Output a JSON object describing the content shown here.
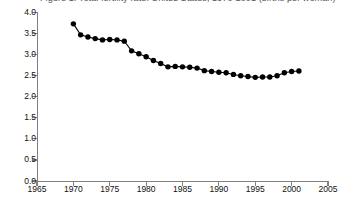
{
  "chart_data": {
    "type": "line",
    "title": "Figure 1. Total fertility rate: United States, 1970-2001 (births per woman)",
    "xlabel": "",
    "ylabel": "",
    "xlim": [
      1965,
      2005
    ],
    "ylim": [
      0.0,
      4.0
    ],
    "grid": false,
    "legend": "none",
    "marker": "filled-circle",
    "marker_color": "#000000",
    "line_color": "#000000",
    "background_color": "#ffffff",
    "axis_color": "#808080",
    "xticks": [
      1965,
      1970,
      1975,
      1980,
      1985,
      1990,
      1995,
      2000,
      2005
    ],
    "xtick_labels": [
      "1965",
      "1970",
      "1975",
      "1980",
      "1985",
      "1990",
      "1995",
      "2000",
      "2005"
    ],
    "yticks": [
      0.0,
      0.5,
      1.0,
      1.5,
      2.0,
      2.5,
      3.0,
      3.5,
      4.0
    ],
    "ytick_labels": [
      "0.0",
      "0.5",
      "1.0",
      "1.5",
      "2.0",
      "2.5",
      "3.0",
      "3.5",
      "4.0"
    ],
    "x": [
      1970,
      1971,
      1972,
      1973,
      1974,
      1975,
      1976,
      1977,
      1978,
      1979,
      1980,
      1981,
      1982,
      1983,
      1984,
      1985,
      1986,
      1987,
      1988,
      1989,
      1990,
      1991,
      1992,
      1993,
      1994,
      1995,
      1996,
      1997,
      1998,
      1999,
      2000,
      2001
    ],
    "values": [
      3.73,
      3.47,
      3.42,
      3.38,
      3.35,
      3.36,
      3.35,
      3.32,
      3.09,
      3.02,
      2.95,
      2.86,
      2.79,
      2.71,
      2.72,
      2.71,
      2.7,
      2.68,
      2.62,
      2.6,
      2.58,
      2.57,
      2.53,
      2.5,
      2.48,
      2.46,
      2.47,
      2.47,
      2.5,
      2.57,
      2.6,
      2.61
    ],
    "series_name": "Rate"
  }
}
